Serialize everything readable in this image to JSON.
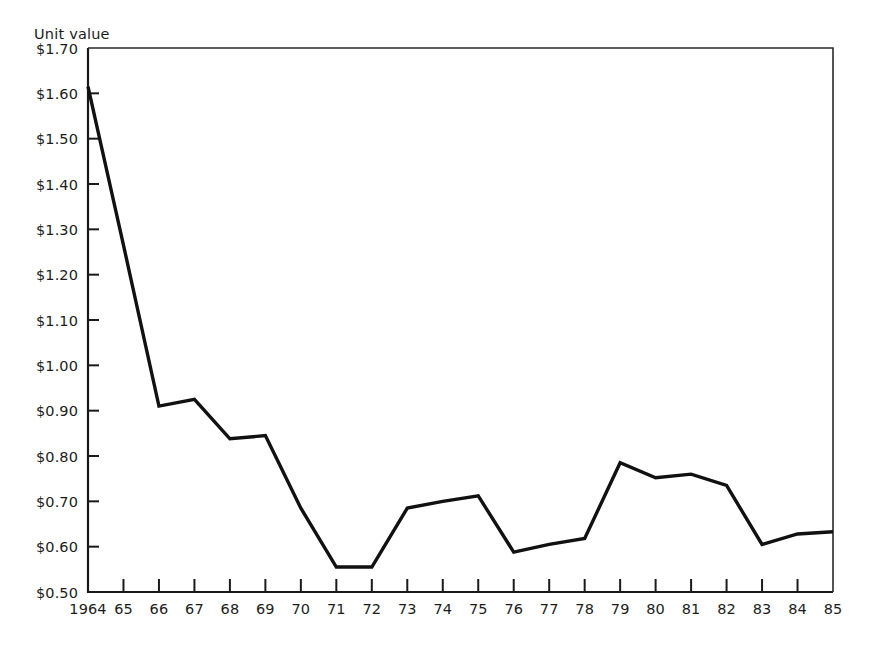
{
  "chart_data": {
    "type": "line",
    "title": "",
    "ylabel": "Unit value",
    "xlabel": "",
    "categories": [
      "1964",
      "65",
      "66",
      "67",
      "68",
      "69",
      "70",
      "71",
      "72",
      "73",
      "74",
      "75",
      "76",
      "77",
      "78",
      "79",
      "80",
      "81",
      "82",
      "83",
      "84",
      "85"
    ],
    "x": [
      1964,
      1965,
      1966,
      1967,
      1968,
      1969,
      1970,
      1971,
      1972,
      1973,
      1974,
      1975,
      1976,
      1977,
      1978,
      1979,
      1980,
      1981,
      1982,
      1983,
      1984,
      1985
    ],
    "values": [
      1.615,
      1.265,
      0.91,
      0.925,
      0.838,
      0.845,
      0.685,
      0.555,
      0.555,
      0.685,
      0.7,
      0.712,
      0.588,
      0.605,
      0.618,
      0.785,
      0.752,
      0.76,
      0.735,
      0.605,
      0.628,
      0.633
    ],
    "ytick_labels": [
      "$1.70",
      "$1.60",
      "$1.50",
      "$1.40",
      "$1.30",
      "$1.20",
      "$1.10",
      "$1.00",
      "$0.90",
      "$0.80",
      "$0.70",
      "$0.60",
      "$0.50"
    ],
    "ytick_values": [
      1.7,
      1.6,
      1.5,
      1.4,
      1.3,
      1.2,
      1.1,
      1.0,
      0.9,
      0.8,
      0.7,
      0.6,
      0.5
    ],
    "ylim": [
      0.5,
      1.7
    ],
    "xlim": [
      1964,
      1985
    ],
    "grid": false,
    "legend": "none",
    "line_color": "#111111"
  }
}
